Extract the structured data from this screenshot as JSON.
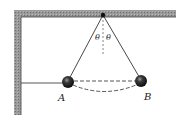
{
  "diagram": {
    "type": "physics-pendulum",
    "labels": {
      "angle_left": "θ",
      "angle_right": "θ",
      "point_a": "A",
      "point_b": "B"
    },
    "colors": {
      "support": "#8a8a8a",
      "support_edge": "#333333",
      "string": "#333333",
      "ball": "#1a1a1a",
      "dashed": "#555555"
    }
  }
}
